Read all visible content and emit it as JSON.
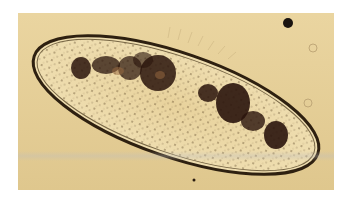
{
  "image": {
    "subject": "paramecium under light microscope",
    "background_color": "#e3cc93",
    "cell_membrane_color": "#3a2a14",
    "cell_interior_color": "#ead8a8",
    "organelle_color": "#2a140c"
  }
}
